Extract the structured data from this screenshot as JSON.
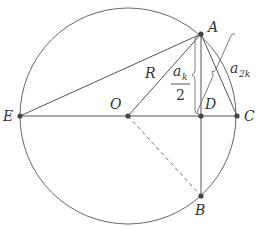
{
  "diagram": {
    "title": "",
    "colors": {
      "line": "#555555",
      "point": "#444444",
      "text": "#333333",
      "background": "#ffffff"
    },
    "circle": {
      "center": "O",
      "cx": 128,
      "cy": 116,
      "r": 108
    },
    "points": [
      {
        "id": "A",
        "label": "A",
        "x": 201,
        "y": 34
      },
      {
        "id": "B",
        "label": "B",
        "x": 201,
        "y": 196
      },
      {
        "id": "C",
        "label": "C",
        "x": 237,
        "y": 116
      },
      {
        "id": "D",
        "label": "D",
        "x": 201,
        "y": 116
      },
      {
        "id": "E",
        "label": "E",
        "x": 20,
        "y": 116
      },
      {
        "id": "O",
        "label": "O",
        "x": 128,
        "y": 116
      }
    ],
    "segments": [
      {
        "from": "E",
        "to": "C",
        "style": "solid"
      },
      {
        "from": "E",
        "to": "A",
        "style": "solid"
      },
      {
        "from": "O",
        "to": "A",
        "style": "solid",
        "label": "R"
      },
      {
        "from": "A",
        "to": "B",
        "style": "solid"
      },
      {
        "from": "A",
        "to": "C",
        "style": "solid"
      },
      {
        "from": "O",
        "to": "B",
        "style": "dashed"
      }
    ],
    "annotations": {
      "radius_label": "R",
      "half_chord": {
        "base": "a",
        "subscript": "k",
        "denominator": "2"
      },
      "chord_2k": {
        "base": "a",
        "subscript": "2k"
      }
    },
    "labels": {
      "A": "A",
      "B": "B",
      "C": "C",
      "D": "D",
      "E": "E",
      "O": "O"
    }
  }
}
